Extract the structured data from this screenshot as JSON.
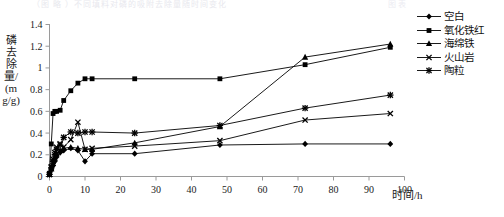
{
  "top_crop": {
    "left_text": "（图 略 ）不同填料对磷的吸附去除量随时间变化",
    "right_text": "图 表"
  },
  "axes": {
    "ylabel": "磷去除量/(mg/g)",
    "xlabel": "时间/h",
    "y_ticks": [
      "0",
      "0.2",
      "0.4",
      "0.6",
      "0.8",
      "1",
      "1.2",
      "1.4"
    ],
    "x_ticks": [
      "0",
      "10",
      "20",
      "30",
      "40",
      "50",
      "60",
      "70",
      "80",
      "90",
      "100"
    ]
  },
  "legend": {
    "items": [
      {
        "label": "空白",
        "marker": "diamond-marker"
      },
      {
        "label": "氧化铁红",
        "marker": "square-marker"
      },
      {
        "label": "海绵铁",
        "marker": "triangle-marker"
      },
      {
        "label": "火山岩",
        "marker": "x-marker"
      },
      {
        "label": "陶粒",
        "marker": "star-marker"
      }
    ]
  },
  "chart_data": {
    "type": "line",
    "title": "",
    "xlabel": "时间/h",
    "ylabel": "磷去除量/(mg/g)",
    "xlim": [
      0,
      100
    ],
    "ylim": [
      0,
      1.4
    ],
    "xticks": [
      0,
      10,
      20,
      30,
      40,
      50,
      60,
      70,
      80,
      90,
      100
    ],
    "yticks": [
      0,
      0.2,
      0.4,
      0.6,
      0.8,
      1.0,
      1.2,
      1.4
    ],
    "grid": false,
    "legend_position": "right",
    "series": [
      {
        "name": "空白",
        "marker": "diamond",
        "color": "#000000",
        "x": [
          0,
          0.5,
          1,
          1.5,
          2,
          3,
          4,
          6,
          8,
          10,
          12,
          24,
          48,
          72,
          96
        ],
        "y": [
          0.02,
          0.06,
          0.1,
          0.14,
          0.18,
          0.22,
          0.24,
          0.26,
          0.24,
          0.14,
          0.21,
          0.21,
          0.29,
          0.3,
          0.3
        ]
      },
      {
        "name": "氧化铁红",
        "marker": "square",
        "color": "#000000",
        "x": [
          0,
          0.5,
          1,
          1.5,
          2,
          3,
          4,
          6,
          8,
          10,
          12,
          24,
          48,
          72,
          96
        ],
        "y": [
          0.03,
          0.3,
          0.58,
          0.6,
          0.6,
          0.61,
          0.7,
          0.79,
          0.86,
          0.9,
          0.9,
          0.9,
          0.9,
          1.03,
          1.19
        ]
      },
      {
        "name": "海绵铁",
        "marker": "triangle",
        "color": "#000000",
        "x": [
          0,
          0.5,
          1,
          1.5,
          2,
          3,
          4,
          6,
          8,
          10,
          12,
          24,
          48,
          72,
          96
        ],
        "y": [
          0.02,
          0.07,
          0.12,
          0.17,
          0.21,
          0.24,
          0.26,
          0.27,
          0.26,
          0.25,
          0.25,
          0.31,
          0.46,
          1.1,
          1.22
        ]
      },
      {
        "name": "火山岩",
        "marker": "x",
        "color": "#000000",
        "x": [
          0,
          0.5,
          1,
          1.5,
          2,
          3,
          4,
          6,
          8,
          10,
          12,
          24,
          48,
          72,
          96
        ],
        "y": [
          0.02,
          0.09,
          0.16,
          0.22,
          0.27,
          0.3,
          0.27,
          0.34,
          0.5,
          0.25,
          0.26,
          0.28,
          0.33,
          0.52,
          0.58
        ]
      },
      {
        "name": "陶粒",
        "marker": "star",
        "color": "#000000",
        "x": [
          0,
          0.5,
          1,
          1.5,
          2,
          3,
          4,
          6,
          8,
          10,
          12,
          24,
          48,
          72,
          96
        ],
        "y": [
          0.02,
          0.08,
          0.14,
          0.2,
          0.25,
          0.29,
          0.36,
          0.41,
          0.4,
          0.41,
          0.41,
          0.4,
          0.47,
          0.63,
          0.75
        ]
      }
    ]
  }
}
